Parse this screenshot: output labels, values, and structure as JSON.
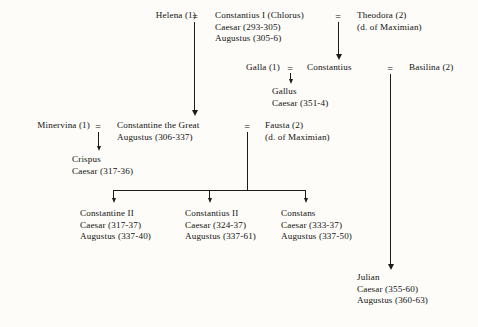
{
  "figure": {
    "kind": "genealogical-tree",
    "ink_color": "#1b1b1b",
    "paper_color": "#fdfcf8"
  },
  "symbols": {
    "marriage": "=",
    "marriage_helena": "=",
    "marriage_theodora": "=",
    "marriage_galla": "=",
    "marriage_basilina": "=",
    "marriage_minervina": "=",
    "marriage_fausta": "="
  },
  "people": {
    "helena": {
      "line1": "Helena (1)"
    },
    "constantius_chlorus": {
      "line1": "Constantius I (Chlorus)",
      "line2": "Caesar (293-305)",
      "line3": "Augustus (305-6)"
    },
    "theodora": {
      "line1": "Theodora (2)",
      "line2": "(d. of Maximian)"
    },
    "galla": {
      "line1": "Galla (1)"
    },
    "constantius": {
      "line1": "Constantius"
    },
    "basilina": {
      "line1": "Basilina (2)"
    },
    "gallus": {
      "line1": "Gallus",
      "line2": "Caesar (351-4)"
    },
    "minervina": {
      "line1": "Minervina (1)"
    },
    "constantine_the_great": {
      "line1": "Constantine the Great",
      "line2": "Augustus (306-337)"
    },
    "fausta": {
      "line1": "Fausta (2)",
      "line2": "(d. of Maximian)"
    },
    "crispus": {
      "line1": "Crispus",
      "line2": "Caesar (317-36)"
    },
    "constantine_ii": {
      "line1": "Constantine II",
      "line2": "Caesar (317-37)",
      "line3": "Augustus (337-40)"
    },
    "constantius_ii": {
      "line1": "Constantius II",
      "line2": "Caesar (324-37)",
      "line3": "Augustus (337-61)"
    },
    "constans": {
      "line1": "Constans",
      "line2": "Caesar (333-37)",
      "line3": "Augustus (337-50)"
    },
    "julian": {
      "line1": "Julian",
      "line2": "Caesar (355-60)",
      "line3": "Augustus (360-63)"
    }
  }
}
